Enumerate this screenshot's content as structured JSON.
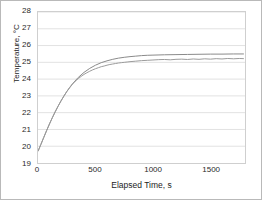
{
  "chart_data": {
    "type": "line",
    "title": "",
    "xlabel": "Elapsed Time, s",
    "ylabel": "Temperature, °C",
    "xlim": [
      0,
      1800
    ],
    "ylim": [
      19,
      28
    ],
    "xticks": [
      0,
      500,
      1000,
      1500
    ],
    "xtick_labels": [
      "0",
      "500",
      "1000",
      "1500"
    ],
    "yticks": [
      19,
      20,
      21,
      22,
      23,
      24,
      25,
      26,
      27,
      28
    ],
    "ytick_labels": [
      "19",
      "20",
      "21",
      "22",
      "23",
      "24",
      "25",
      "26",
      "27",
      "28"
    ],
    "grid": "horizontal",
    "grid_color": "#e2e2e2",
    "legend": "none",
    "line_color": "#8a8a8a",
    "series": [
      {
        "name": "smooth-model",
        "color": "#8a8a8a",
        "x": [
          0,
          25,
          50,
          75,
          100,
          125,
          150,
          175,
          200,
          225,
          250,
          275,
          300,
          350,
          400,
          450,
          500,
          550,
          600,
          650,
          700,
          750,
          800,
          850,
          900,
          950,
          1000,
          1100,
          1200,
          1300,
          1400,
          1500,
          1600,
          1700,
          1790
        ],
        "y": [
          19.7,
          20.1,
          20.52,
          20.93,
          21.33,
          21.7,
          22.06,
          22.39,
          22.7,
          22.99,
          23.26,
          23.5,
          23.72,
          24.1,
          24.4,
          24.64,
          24.83,
          24.98,
          25.09,
          25.18,
          25.25,
          25.3,
          25.34,
          25.37,
          25.4,
          25.42,
          25.43,
          25.45,
          25.46,
          25.47,
          25.48,
          25.49,
          25.49,
          25.5,
          25.5
        ]
      },
      {
        "name": "measured-noisy",
        "color": "#9b9b9b",
        "x": [
          0,
          25,
          50,
          75,
          100,
          125,
          150,
          175,
          200,
          225,
          250,
          275,
          300,
          325,
          350,
          375,
          400,
          425,
          450,
          475,
          500,
          525,
          550,
          575,
          600,
          625,
          650,
          675,
          700,
          725,
          750,
          775,
          800,
          850,
          900,
          950,
          1000,
          1050,
          1100,
          1150,
          1200,
          1250,
          1300,
          1350,
          1400,
          1450,
          1500,
          1550,
          1600,
          1650,
          1700,
          1750,
          1790
        ],
        "y": [
          19.7,
          20.11,
          20.53,
          20.94,
          21.33,
          21.71,
          22.06,
          22.39,
          22.7,
          22.98,
          23.25,
          23.48,
          23.7,
          23.88,
          24.03,
          24.16,
          24.28,
          24.38,
          24.47,
          24.55,
          24.62,
          24.68,
          24.74,
          24.78,
          24.83,
          24.87,
          24.9,
          24.93,
          24.96,
          24.98,
          25.0,
          25.02,
          25.04,
          25.07,
          25.1,
          25.12,
          25.14,
          25.16,
          25.17,
          25.15,
          25.18,
          25.19,
          25.17,
          25.2,
          25.18,
          25.21,
          25.19,
          25.22,
          25.2,
          25.23,
          25.21,
          25.23,
          25.22
        ]
      }
    ]
  }
}
